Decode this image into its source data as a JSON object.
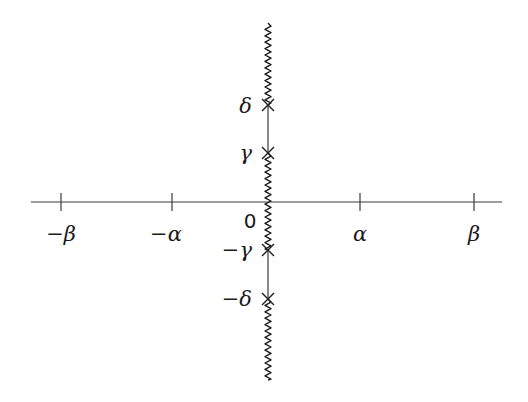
{
  "diagram": {
    "origin_label": "0",
    "real_axis": {
      "x_start": 31,
      "x_end": 502,
      "y": 202,
      "ticks": [
        {
          "id": "neg-beta",
          "x": 61,
          "label": "−β"
        },
        {
          "id": "neg-alpha",
          "x": 172,
          "label": "−α"
        },
        {
          "id": "alpha",
          "x": 360,
          "label": "α"
        },
        {
          "id": "beta",
          "x": 474,
          "label": "β"
        }
      ]
    },
    "imaginary_axis": {
      "x": 268,
      "y_top": 23,
      "y_bottom": 380,
      "branch_cuts": [
        {
          "id": "upper-cut",
          "from": 23,
          "to": 105
        },
        {
          "id": "middle-cut",
          "from": 153,
          "to": 250
        },
        {
          "id": "lower-cut",
          "from": 299,
          "to": 380
        }
      ],
      "straight_segments": [
        {
          "id": "delta-gamma-segment",
          "from": 105,
          "to": 153
        },
        {
          "id": "neg-gamma-neg-delta-segment",
          "from": 250,
          "to": 299
        }
      ],
      "markers": [
        {
          "id": "delta",
          "y": 105,
          "label": "δ"
        },
        {
          "id": "gamma",
          "y": 153,
          "label": "γ"
        },
        {
          "id": "neg-gamma",
          "y": 250,
          "label": "−γ"
        },
        {
          "id": "neg-delta",
          "y": 299,
          "label": "−δ"
        }
      ]
    },
    "colors": {
      "line": "#3a3a3a",
      "ink": "#1a1a1a",
      "background": "#ffffff"
    }
  }
}
